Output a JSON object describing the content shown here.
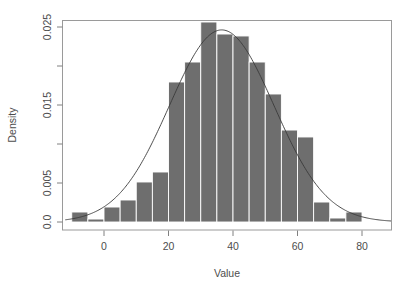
{
  "chart_data": {
    "type": "bar",
    "title": "",
    "subtitle": "",
    "xlabel": "Value",
    "ylabel": "Density",
    "xlim": [
      -12,
      90
    ],
    "ylim": [
      0,
      0.0268
    ],
    "grid": false,
    "legend": null,
    "bin_width": 5,
    "categories": [
      "-10 to -5",
      "-5 to 0",
      "0 to 5",
      "5 to 10",
      "10 to 15",
      "15 to 20",
      "20 to 25",
      "25 to 30",
      "30 to 35",
      "35 to 40",
      "40 to 45",
      "45 to 50",
      "50 to 55",
      "55 to 60",
      "60 to 65",
      "65 to 70",
      "70 to 75",
      "75 to 80"
    ],
    "bin_starts": [
      -10,
      -5,
      0,
      5,
      10,
      15,
      20,
      25,
      30,
      35,
      40,
      45,
      50,
      55,
      60,
      65,
      70,
      75
    ],
    "bin_ends": [
      -5,
      0,
      5,
      10,
      15,
      20,
      25,
      30,
      35,
      40,
      45,
      50,
      55,
      60,
      65,
      70,
      75,
      80
    ],
    "values": [
      0.00128,
      0.00038,
      0.00192,
      0.00282,
      0.00513,
      0.00641,
      0.01795,
      0.02051,
      0.02564,
      0.0241,
      0.02385,
      0.02051,
      0.01641,
      0.01179,
      0.0109,
      0.00256,
      0.00051,
      0.00128
    ],
    "xticks": [
      0,
      20,
      40,
      60,
      80
    ],
    "xtick_labels": [
      "0",
      "20",
      "40",
      "60",
      "80"
    ],
    "yticks": [
      0.0,
      0.005,
      0.01,
      0.015,
      0.02,
      0.025
    ],
    "ytick_labels": [
      "0.0",
      "",
      "0.005",
      "",
      "0.015",
      "",
      "0.025"
    ],
    "ytick_labels_shown": [
      "0.0",
      "0.005",
      "0.015",
      "0.025"
    ],
    "ytick_labeled_values": [
      0.0,
      0.005,
      0.015,
      0.025
    ],
    "ytick_unlabeled_values": [
      0.01,
      0.02
    ],
    "bar_color": "#6e6e6e",
    "bar_border_color": "#ffffff",
    "curve_color": "#3a3a3a",
    "axis_color": "#808080",
    "background_color": "#ffffff",
    "overlay_curve": {
      "name": "normal density",
      "mean": 36.5,
      "sd": 16.2,
      "peak_value": 0.02462,
      "visible": true
    }
  }
}
